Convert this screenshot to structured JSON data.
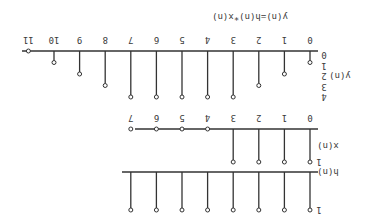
{
  "figure": {
    "orientation": "rotated-180",
    "ink_color": "#333333",
    "background": "#ffffff",
    "panels": [
      {
        "id": "h",
        "ylabel": "h(n)",
        "ytick": "1",
        "n": [
          0,
          1,
          2,
          3,
          4,
          5,
          6,
          7
        ],
        "values": [
          1,
          1,
          1,
          1,
          1,
          1,
          1,
          1
        ]
      },
      {
        "id": "x",
        "ylabel": "x(n)",
        "ytick": "1",
        "n": [
          0,
          1,
          2,
          3,
          4,
          5,
          6,
          7
        ],
        "values": [
          1,
          1,
          1,
          1,
          0,
          0,
          0,
          0
        ],
        "xticks": [
          "0",
          "1",
          "2",
          "3",
          "4",
          "5",
          "6",
          "7"
        ]
      },
      {
        "id": "y",
        "ylabel": "y(n)",
        "yticks": [
          "0",
          "1",
          "2",
          "3",
          "4"
        ],
        "title": "y(n)=h(n)*x(n)",
        "n": [
          0,
          1,
          2,
          3,
          4,
          5,
          6,
          7,
          8,
          9,
          10,
          11
        ],
        "values": [
          1,
          2,
          3,
          4,
          4,
          4,
          4,
          4,
          3,
          2,
          1,
          0
        ],
        "xticks": [
          "0",
          "1",
          "2",
          "3",
          "4",
          "5",
          "6",
          "7",
          "8",
          "9",
          "10",
          "11"
        ]
      }
    ]
  },
  "chart_data": [
    {
      "type": "stem",
      "title": "",
      "ylabel": "h(n)",
      "x": [
        0,
        1,
        2,
        3,
        4,
        5,
        6,
        7
      ],
      "values": [
        1,
        1,
        1,
        1,
        1,
        1,
        1,
        1
      ]
    },
    {
      "type": "stem",
      "title": "",
      "ylabel": "x(n)",
      "x": [
        0,
        1,
        2,
        3,
        4,
        5,
        6,
        7
      ],
      "values": [
        1,
        1,
        1,
        1,
        0,
        0,
        0,
        0
      ]
    },
    {
      "type": "stem",
      "title": "y(n)=h(n)*x(n)",
      "ylabel": "y(n)",
      "x": [
        0,
        1,
        2,
        3,
        4,
        5,
        6,
        7,
        8,
        9,
        10,
        11
      ],
      "values": [
        1,
        2,
        3,
        4,
        4,
        4,
        4,
        4,
        3,
        2,
        1,
        0
      ],
      "ylim": [
        0,
        4
      ]
    }
  ]
}
